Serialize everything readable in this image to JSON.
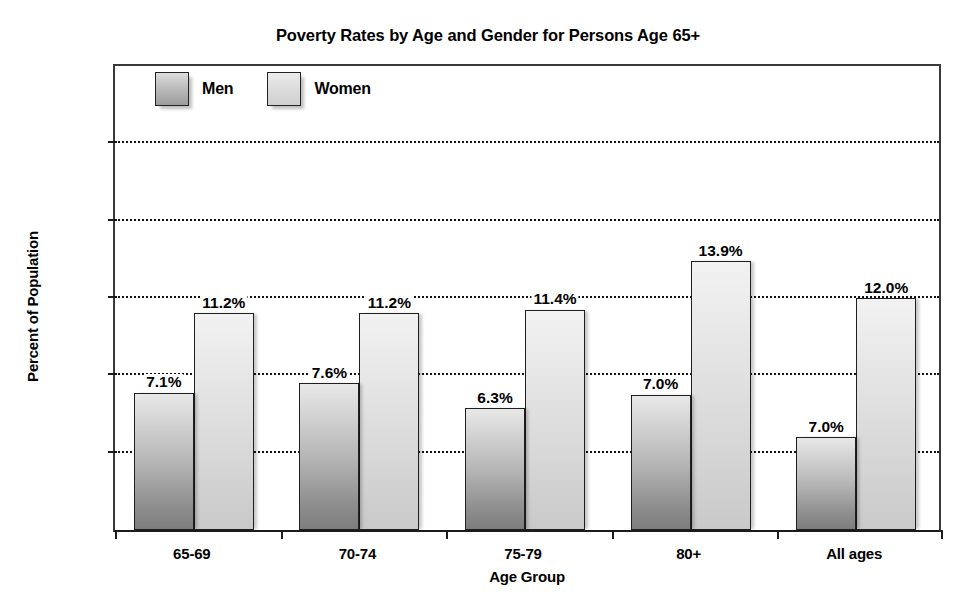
{
  "chart_data": {
    "type": "bar",
    "title": "Poverty Rates by Age and Gender for Persons Age 65+",
    "xlabel": "Age Group",
    "ylabel": "Percent of Population",
    "categories": [
      "65-69",
      "70-74",
      "75-79",
      "80+",
      "All ages"
    ],
    "series": [
      {
        "name": "Men",
        "values": [
          7.1,
          7.6,
          6.3,
          7.0,
          7.0
        ],
        "plotted_values": [
          7.1,
          7.6,
          6.3,
          7.0,
          4.8
        ],
        "labels": [
          "7.1%",
          "7.6%",
          "6.3%",
          "7.0%",
          "7.0%"
        ],
        "color": "#b0b0b0"
      },
      {
        "name": "Women",
        "values": [
          11.2,
          11.2,
          11.4,
          13.9,
          12.0
        ],
        "plotted_values": [
          11.2,
          11.2,
          11.4,
          13.9,
          12.0
        ],
        "labels": [
          "11.2%",
          "11.2%",
          "11.4%",
          "13.9%",
          "12.0%"
        ],
        "color": "#dcdcdc"
      }
    ],
    "ylim": [
      0,
      24
    ],
    "yticks": [
      0,
      4,
      8,
      12,
      16,
      20,
      24
    ],
    "ytick_labels": [
      "0",
      "4.0",
      "8.0",
      "12.0",
      "16.0",
      "20.0",
      "24.0"
    ],
    "grid": "horizontal-dotted",
    "legend_position": "top-left-inside"
  },
  "legend": {
    "entries": [
      {
        "label": "Men"
      },
      {
        "label": "Women"
      }
    ]
  }
}
